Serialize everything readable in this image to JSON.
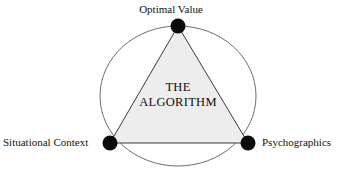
{
  "diagram": {
    "center_label": {
      "line1": "THE",
      "line2": "ALGORITHM"
    },
    "nodes": [
      {
        "id": "optimal-value",
        "label": "Optimal Value",
        "position": "top",
        "x": 178,
        "y": 26,
        "marker": "filled-circle"
      },
      {
        "id": "situational-context",
        "label": "Situational Context",
        "position": "bottom-left",
        "x": 110,
        "y": 143,
        "marker": "filled-circle"
      },
      {
        "id": "psychographics",
        "label": "Psychographics",
        "position": "bottom-right",
        "x": 248,
        "y": 143,
        "marker": "filled-circle"
      }
    ],
    "shapes": {
      "circle": {
        "name": "enclosing-ellipse",
        "cx": 178,
        "cy": 96,
        "rx": 78,
        "ry": 70
      },
      "triangle": {
        "name": "algorithm-triangle",
        "points": "178,26 110,143 248,143"
      }
    },
    "colors": {
      "background": "#ffffff",
      "triangle_fill": "#ededed",
      "triangle_stroke": "#3a3a3a",
      "circle_stroke": "#6e6e6e",
      "node_fill": "#0a0a0a",
      "text": "#111111"
    }
  }
}
